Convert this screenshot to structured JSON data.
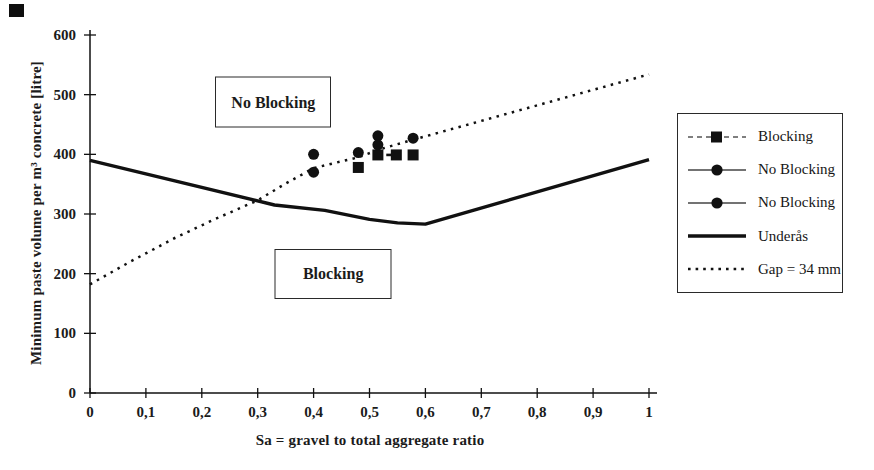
{
  "figure": {
    "background": "#ffffff",
    "ink_color": "#111111",
    "text_color": "#1b1b1b"
  },
  "legend": {
    "position": "outside-right",
    "items": [
      {
        "label": "Blocking",
        "marker": "square",
        "line": "dashed"
      },
      {
        "label": "No Blocking",
        "marker": "circle",
        "line": "solid-thin"
      },
      {
        "label": "No Blocking",
        "marker": "circle",
        "line": "solid-thin"
      },
      {
        "label": "Underås",
        "marker": "none",
        "line": "solid-thick"
      },
      {
        "label": "Gap = 34 mm",
        "marker": "none",
        "line": "dotted"
      }
    ]
  },
  "chart_data": {
    "type": "scatter",
    "title": "",
    "xlabel": "Sa = gravel to total aggregate ratio",
    "ylabel": "Minimum paste volume per m³ concrete [litre]",
    "xlim": [
      0,
      1
    ],
    "ylim": [
      0,
      600
    ],
    "grid": false,
    "legend_position": "outside-right",
    "x_ticks": {
      "values": [
        0,
        0.1,
        0.2,
        0.3,
        0.4,
        0.5,
        0.6,
        0.7,
        0.8,
        0.9,
        1
      ],
      "labels": [
        "0",
        "0,1",
        "0,2",
        "0,3",
        "0,4",
        "0,5",
        "0,6",
        "0,7",
        "0,8",
        "0,9",
        "1"
      ]
    },
    "y_ticks": {
      "values": [
        0,
        100,
        200,
        300,
        400,
        500,
        600
      ],
      "labels": [
        "0",
        "100",
        "200",
        "300",
        "400",
        "500",
        "600"
      ]
    },
    "annotations": [
      {
        "text": "No Blocking",
        "x": 0.328,
        "y": 487
      },
      {
        "text": "Blocking",
        "x": 0.435,
        "y": 200
      }
    ],
    "series": [
      {
        "name": "Blocking",
        "kind": "scatter",
        "marker": "square",
        "points": [
          [
            0.48,
            378
          ],
          [
            0.515,
            399
          ],
          [
            0.548,
            399
          ],
          [
            0.578,
            399
          ]
        ],
        "connector_points": [
          [
            0.53,
            399
          ],
          [
            0.545,
            399
          ]
        ]
      },
      {
        "name": "No Blocking",
        "kind": "scatter",
        "marker": "circle",
        "points": [
          [
            0.4,
            400
          ],
          [
            0.48,
            403
          ],
          [
            0.515,
            431
          ],
          [
            0.578,
            427
          ]
        ]
      },
      {
        "name": "No Blocking",
        "kind": "scatter",
        "marker": "circle",
        "points": [
          [
            0.4,
            370
          ],
          [
            0.515,
            416
          ]
        ]
      },
      {
        "name": "Underås",
        "kind": "line",
        "style": "solid",
        "points": [
          [
            0,
            390
          ],
          [
            0.15,
            356
          ],
          [
            0.33,
            315
          ],
          [
            0.42,
            306
          ],
          [
            0.5,
            291
          ],
          [
            0.55,
            285
          ],
          [
            0.6,
            283
          ],
          [
            1,
            391
          ]
        ]
      },
      {
        "name": "Gap = 34 mm",
        "kind": "line",
        "style": "dotted",
        "points": [
          [
            0,
            182
          ],
          [
            0.07,
            219
          ],
          [
            0.15,
            259
          ],
          [
            0.22,
            290
          ],
          [
            0.3,
            323
          ],
          [
            0.35,
            351
          ],
          [
            0.4,
            377
          ],
          [
            0.48,
            395
          ],
          [
            0.52,
            409
          ],
          [
            0.58,
            425
          ],
          [
            0.7,
            456
          ],
          [
            0.85,
            495
          ],
          [
            1,
            534
          ]
        ]
      }
    ]
  }
}
